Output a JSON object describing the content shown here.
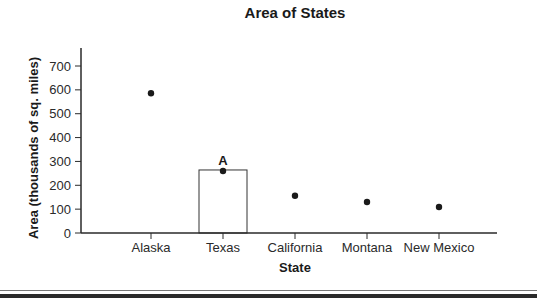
{
  "chart_data": {
    "type": "scatter",
    "title": "Area of States",
    "xlabel": "State",
    "ylabel": "Area (thousands of sq. miles)",
    "categories": [
      "Alaska",
      "Texas",
      "California",
      "Montana",
      "New Mexico"
    ],
    "values": [
      586,
      260,
      156,
      130,
      109
    ],
    "ylim": [
      0,
      700
    ],
    "yticks": [
      0,
      100,
      200,
      300,
      400,
      500,
      600,
      700
    ],
    "grid": false,
    "legend": null,
    "highlight_bar": {
      "category": "Texas",
      "value": 260
    },
    "annotations": [
      {
        "text": "A",
        "category": "Texas",
        "value": 260
      }
    ]
  },
  "colors": {
    "point": "#1a1a1a",
    "axis": "#2a2a2a",
    "bar_fill": "#ffffff",
    "bar_stroke": "#333333"
  }
}
